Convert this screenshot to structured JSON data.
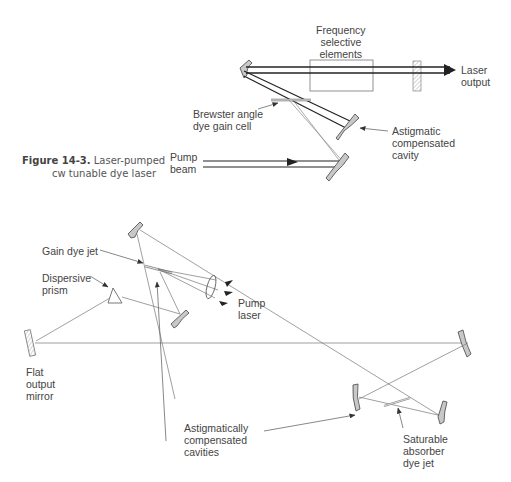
{
  "figure": {
    "number": "Figure 14-3.",
    "caption_line1": "Laser-pumped",
    "caption_line2": "cw tunable dye laser"
  },
  "top_diagram": {
    "labels": {
      "frequency_selective": "Frequency\nselective\nelements",
      "laser_output": "Laser\noutput",
      "brewster_cell": "Brewster angle\ndye gain cell",
      "astigmatic_cavity": "Astigmatic\ncompensated\ncavity",
      "pump_beam": "Pump\nbeam"
    }
  },
  "bottom_diagram": {
    "labels": {
      "gain_dye_jet": "Gain dye jet",
      "dispersive_prism": "Dispersive\nprism",
      "pump_laser": "Pump\nlaser",
      "flat_output_mirror": "Flat\noutput\nmirror",
      "astigmatically_compensated": "Astigmatically\ncompensated\ncavities",
      "saturable_absorber": "Saturable\nabsorber\ndye jet"
    }
  },
  "colors": {
    "line": "#333333",
    "thin_line": "#777777",
    "mirror_fill": "#c8c8c8"
  }
}
